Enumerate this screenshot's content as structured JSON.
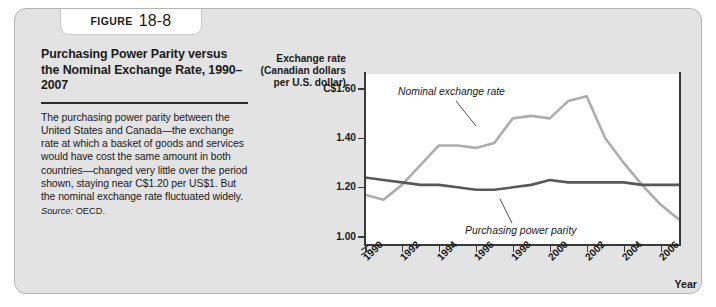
{
  "figure": {
    "label": "FIGURE",
    "number": "18-8",
    "title": "Purchasing Power Parity versus the Nominal Exchange Rate, 1990–2007",
    "body": "The purchasing power parity between the United States and Canada—the exchange rate at which a basket of goods and services would have cost the same amount in both countries—changed very little over the period shown, staying near C$1.20 per US$1. But the nominal exchange rate fluctuated widely.",
    "source_label": "Source:",
    "source_value": "OECD."
  },
  "chart_data": {
    "type": "line",
    "title": "",
    "ylabel": "Exchange rate (Canadian dollars per U.S. dollar)",
    "ylabel_lines": [
      "Exchange rate",
      "(Canadian dollars",
      "per U.S. dollar)"
    ],
    "xlabel": "Year",
    "x": [
      1990,
      1991,
      1992,
      1993,
      1994,
      1995,
      1996,
      1997,
      1998,
      1999,
      2000,
      2001,
      2002,
      2003,
      2004,
      2005,
      2006,
      2007
    ],
    "xticks": [
      1990,
      1992,
      1994,
      1996,
      1998,
      2000,
      2002,
      2004,
      2006
    ],
    "xtick_labels": [
      "1990",
      "1992",
      "1994",
      "1996",
      "1998",
      "2000",
      "2002",
      "2004",
      "2006"
    ],
    "yticks": [
      1.0,
      1.2,
      1.4,
      1.6
    ],
    "ytick_labels": [
      "1.00",
      "1.20",
      "1.40",
      "C$1.60"
    ],
    "ylim": [
      0.97,
      1.66
    ],
    "xlim": [
      1990,
      2007
    ],
    "axis_break": true,
    "grid": false,
    "legend_position": "inline-annotations",
    "series": [
      {
        "name": "Nominal exchange rate",
        "color": "#adadad",
        "values": [
          1.17,
          1.15,
          1.21,
          1.29,
          1.37,
          1.37,
          1.36,
          1.38,
          1.48,
          1.49,
          1.48,
          1.55,
          1.57,
          1.4,
          1.3,
          1.21,
          1.13,
          1.07
        ]
      },
      {
        "name": "Purchasing power parity",
        "color": "#585858",
        "values": [
          1.24,
          1.23,
          1.22,
          1.21,
          1.21,
          1.2,
          1.19,
          1.19,
          1.2,
          1.21,
          1.23,
          1.22,
          1.22,
          1.22,
          1.22,
          1.21,
          1.21,
          1.21
        ]
      }
    ],
    "annotations": [
      {
        "text": "Nominal exchange rate",
        "points_to_year": 1997
      },
      {
        "text": "Purchasing power parity",
        "points_to_year": 2002
      }
    ]
  }
}
